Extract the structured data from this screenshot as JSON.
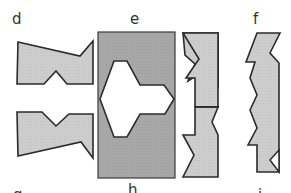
{
  "figure": {
    "labels": {
      "top": [
        "d",
        "e",
        "f"
      ],
      "bottom_partial": [
        "g",
        "h",
        "i"
      ]
    },
    "colors": {
      "light_fill": "#cccccc",
      "dark_panel": "#a6a6a6",
      "outline": "#2b2b2b",
      "background": "#ffffff",
      "cutout": "#ffffff"
    },
    "panels": [
      {
        "id": "d",
        "description": "two light-gray notched pieces stacked vertically"
      },
      {
        "id": "e",
        "description": "dark-gray rectangle with white cross-shaped cutout"
      },
      {
        "id": "e-right",
        "description": "two light-gray zig-zag edged pieces stacked"
      },
      {
        "id": "f",
        "description": "single light-gray zig-zag edged tall piece"
      }
    ]
  }
}
